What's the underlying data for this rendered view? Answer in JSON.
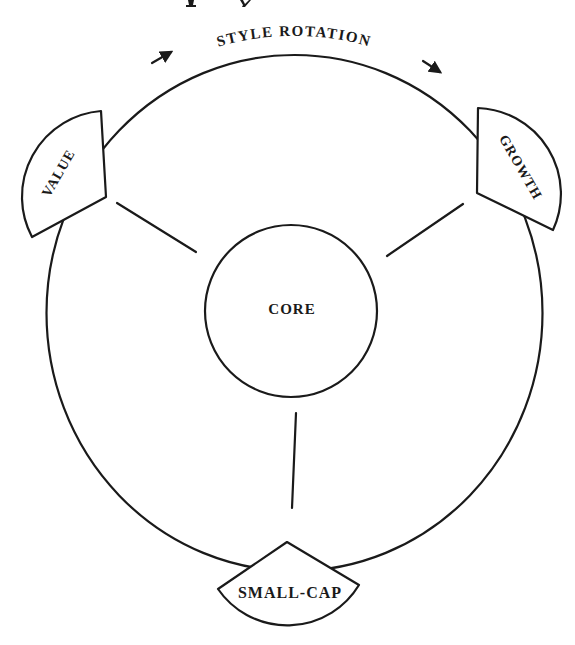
{
  "diagram": {
    "title_arc": "STYLE ROTATION",
    "direction_arrows": [
      "arrow-up-right",
      "arrow-down-right"
    ],
    "center_node": {
      "label": "CORE"
    },
    "outer_nodes": [
      {
        "id": "value",
        "label": "VALUE",
        "position": "upper-left"
      },
      {
        "id": "growth",
        "label": "GROWTH",
        "position": "upper-right"
      },
      {
        "id": "small_cap",
        "label": "SMALL-CAP",
        "position": "bottom"
      }
    ],
    "connections": [
      {
        "from": "CORE",
        "to": "VALUE"
      },
      {
        "from": "CORE",
        "to": "GROWTH"
      },
      {
        "from": "CORE",
        "to": "SMALL-CAP"
      }
    ],
    "colors": {
      "stroke": "#1a1a1a",
      "background": "#ffffff"
    }
  }
}
